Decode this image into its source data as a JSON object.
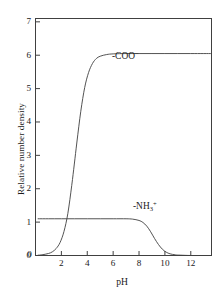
{
  "chart_data": {
    "type": "line",
    "title": "",
    "subtitle": "",
    "xlabel": "pH",
    "ylabel": "Relative number density",
    "xlim": [
      0,
      13.6
    ],
    "ylim": [
      0,
      7.1
    ],
    "xticks": [
      0,
      2,
      4,
      6,
      8,
      10,
      12
    ],
    "yticks": [
      0,
      1,
      2,
      3,
      4,
      5,
      6,
      7
    ],
    "xtick_labels": [
      "0",
      "2",
      "4",
      "6",
      "8",
      "10",
      "12"
    ],
    "ytick_labels": [
      "0",
      "1",
      "2",
      "3",
      "4",
      "5",
      "6",
      "7"
    ],
    "grid": false,
    "legend_position": "inline-annotations",
    "frame": "box",
    "line_color": "#404040",
    "axis_color": "#404040",
    "background": "#ffffff",
    "annotations": [
      {
        "name": "carboxylate-curve-label",
        "text": "-COO",
        "superscript": "−",
        "x": 6.4,
        "y": 5.75
      },
      {
        "name": "ammonium-curve-label",
        "text": "-NH",
        "subscript": "3",
        "superscript": "+",
        "x": 8.1,
        "y": 1.45
      }
    ],
    "series": [
      {
        "name": "-COO−",
        "plateau": 6.05,
        "midpoint_pH": 3.0,
        "shape": "rising sigmoid",
        "x": [
          0.2,
          0.5,
          1.0,
          1.3,
          1.6,
          1.9,
          2.2,
          2.5,
          2.8,
          3.0,
          3.2,
          3.5,
          3.8,
          4.1,
          4.4,
          4.7,
          5.0,
          5.5,
          6.0,
          7.0,
          8.0,
          9.0,
          10.0,
          11.0,
          12.0,
          13.0,
          13.6
        ],
        "values": [
          0.01,
          0.02,
          0.06,
          0.11,
          0.21,
          0.39,
          0.72,
          1.26,
          2.1,
          2.74,
          3.4,
          4.32,
          5.03,
          5.48,
          5.75,
          5.9,
          5.97,
          6.02,
          6.04,
          6.05,
          6.05,
          6.05,
          6.05,
          6.05,
          6.05,
          6.05,
          6.05
        ]
      },
      {
        "name": "-NH3+",
        "plateau": 1.1,
        "midpoint_pH": 9.0,
        "shape": "falling sigmoid",
        "x": [
          0.2,
          1.0,
          2.0,
          3.0,
          4.0,
          5.0,
          6.0,
          7.0,
          7.5,
          8.0,
          8.3,
          8.6,
          8.9,
          9.2,
          9.5,
          9.8,
          10.1,
          10.4,
          10.8,
          11.2,
          12.0,
          13.0,
          13.6
        ],
        "values": [
          1.1,
          1.1,
          1.1,
          1.1,
          1.1,
          1.1,
          1.1,
          1.1,
          1.09,
          1.05,
          0.99,
          0.88,
          0.71,
          0.51,
          0.33,
          0.19,
          0.1,
          0.05,
          0.02,
          0.01,
          0.0,
          0.0,
          0.0
        ]
      }
    ]
  }
}
